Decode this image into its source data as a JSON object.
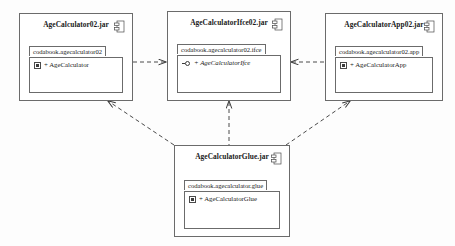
{
  "diagram": {
    "stroke_color": "#6b6b6b",
    "text_color": "#1a1a1a",
    "background": "#fdfdfd"
  },
  "components": [
    {
      "id": "agecalculator02",
      "title": "AgeCalculator02.jar",
      "icon": "component-icon",
      "package": "codabook.agecalculator02",
      "member": "+ AgeCalculator",
      "member_icon": "class-icon",
      "member_italic": false
    },
    {
      "id": "agecalculatorifce02",
      "title": "AgeCalculatorIfce02.jar",
      "icon": "component-icon",
      "package": "codabook.agecalculator02.ifce",
      "member": "+ AgeCalculatorIfce",
      "member_icon": "interface-icon",
      "member_italic": true
    },
    {
      "id": "agecalculatorapp02",
      "title": "AgeCalculatorApp02.jar",
      "icon": "component-icon",
      "package": "codabook.agecalculator02.app",
      "member": "+ AgeCalculatorApp",
      "member_icon": "class-icon",
      "member_italic": false
    },
    {
      "id": "agecalculatorglue",
      "title": "AgeCalculatorGlue.jar",
      "icon": "component-icon",
      "package": "codabook.agecalculator.glue",
      "member": "+ AgeCalculatorGlue",
      "member_icon": "class-icon",
      "member_italic": false
    }
  ],
  "dependencies": [
    {
      "id": "dep-left-to-center",
      "from": "agecalculator02",
      "to": "agecalculatorifce02",
      "style": "dashed",
      "arrow": "open"
    },
    {
      "id": "dep-right-to-center",
      "from": "agecalculatorapp02",
      "to": "agecalculatorifce02",
      "style": "dashed",
      "arrow": "open"
    },
    {
      "id": "dep-glue-to-left",
      "from": "agecalculatorglue",
      "to": "agecalculator02",
      "style": "dashed",
      "arrow": "open"
    },
    {
      "id": "dep-glue-to-center",
      "from": "agecalculatorglue",
      "to": "agecalculatorifce02",
      "style": "dashed",
      "arrow": "open"
    },
    {
      "id": "dep-glue-to-right",
      "from": "agecalculatorglue",
      "to": "agecalculatorapp02",
      "style": "dashed",
      "arrow": "open"
    }
  ]
}
